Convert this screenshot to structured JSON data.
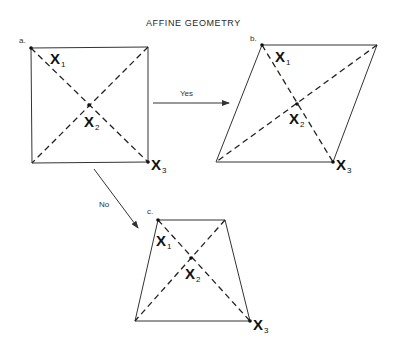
{
  "title": "AFFINE GEOMETRY",
  "arrows": {
    "yes": {
      "label": "Yes"
    },
    "no": {
      "label": "No"
    }
  },
  "figures": {
    "a": {
      "label": "a.",
      "shape": "square",
      "points": {
        "x1": {
          "letter": "X",
          "sub": "1"
        },
        "x2": {
          "letter": "X",
          "sub": "2"
        },
        "x3": {
          "letter": "X",
          "sub": "3"
        }
      }
    },
    "b": {
      "label": "b.",
      "shape": "parallelogram",
      "points": {
        "x1": {
          "letter": "X",
          "sub": "1"
        },
        "x2": {
          "letter": "X",
          "sub": "2"
        },
        "x3": {
          "letter": "X",
          "sub": "3"
        }
      }
    },
    "c": {
      "label": "c.",
      "shape": "trapezoid",
      "points": {
        "x1": {
          "letter": "X",
          "sub": "1"
        },
        "x2": {
          "letter": "X",
          "sub": "2"
        },
        "x3": {
          "letter": "X",
          "sub": "3"
        }
      }
    }
  },
  "colors": {
    "ink": "#222222",
    "background": "#ffffff"
  }
}
